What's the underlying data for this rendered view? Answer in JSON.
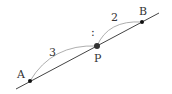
{
  "diagram": {
    "type": "line-segment-ratio",
    "line": {
      "x1": 16,
      "y1": 89,
      "x2": 159,
      "y2": 13,
      "color": "#444444"
    },
    "points": [
      {
        "id": "A",
        "label": "A",
        "x": 30,
        "y": 81,
        "label_x": 17,
        "label_y": 78,
        "radius": 2
      },
      {
        "id": "P",
        "label": "P",
        "x": 97,
        "y": 46,
        "label_x": 94,
        "label_y": 62,
        "radius": 3
      },
      {
        "id": "B",
        "label": "B",
        "x": 142,
        "y": 22,
        "label_x": 139,
        "label_y": 15,
        "radius": 2
      }
    ],
    "arcs": [
      {
        "id": "AP",
        "label": "3",
        "path": "M30,81 Q52,44 97,46",
        "label_x": 49,
        "label_y": 56
      },
      {
        "id": "PB",
        "label": "2",
        "path": "M97,46 Q108,20 142,22",
        "label_x": 111,
        "label_y": 21
      }
    ],
    "ratio_separator": {
      "text": ":",
      "x": 91,
      "y": 36
    },
    "arc_color": "#999999"
  }
}
